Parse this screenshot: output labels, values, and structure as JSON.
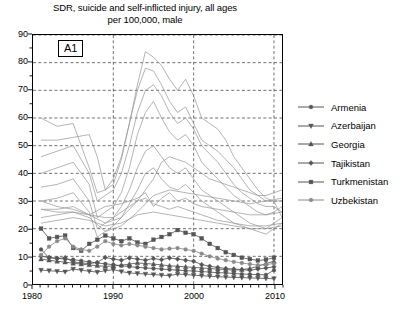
{
  "chart_data": {
    "type": "line",
    "title": "SDR, suicide and self-inflicted injury, all ages per 100,000, male",
    "title_line1": "SDR, suicide and self-inflicted injury, all ages",
    "title_line2": "per 100,000, male",
    "panel_label": "A1",
    "xlabel": "",
    "ylabel": "",
    "xlim": [
      1980,
      2011
    ],
    "ylim": [
      0,
      90
    ],
    "ytick_step": 10,
    "yminor_step": 5,
    "grid": true,
    "grid_style": "dashed",
    "legend_position": "right",
    "xticks": [
      1980,
      1990,
      2000,
      2010
    ],
    "xtick_labels": [
      "1980",
      "1990",
      "2000",
      "2010"
    ],
    "yticks": [
      0,
      10,
      20,
      30,
      40,
      50,
      60,
      70,
      80,
      90
    ],
    "ytick_labels": [
      "0",
      "10",
      "20",
      "30",
      "40",
      "50",
      "60",
      "70",
      "80",
      "90"
    ],
    "series": [
      {
        "name": "Armenia",
        "marker": "circle",
        "color": "#555555",
        "x": [
          1981,
          1982,
          1983,
          1984,
          1985,
          1986,
          1987,
          1988,
          1989,
          1990,
          1991,
          1992,
          1993,
          1994,
          1995,
          1996,
          1997,
          1998,
          1999,
          2000,
          2001,
          2002,
          2003,
          2004,
          2005,
          2006,
          2007,
          2008,
          2009,
          2010
        ],
        "y": [
          12.5,
          9.5,
          9.3,
          9.0,
          8.8,
          8.4,
          8.0,
          7.6,
          7.3,
          7.0,
          6.6,
          6.3,
          6.0,
          5.8,
          5.6,
          5.4,
          5.2,
          5.0,
          4.8,
          4.7,
          4.5,
          4.3,
          4.1,
          4.0,
          3.8,
          3.6,
          3.5,
          3.4,
          3.3,
          5.0
        ]
      },
      {
        "name": "Azerbaijan",
        "marker": "triangle-down",
        "color": "#555555",
        "x": [
          1981,
          1982,
          1983,
          1984,
          1985,
          1986,
          1987,
          1988,
          1989,
          1990,
          1991,
          1992,
          1993,
          1994,
          1995,
          1996,
          1997,
          1998,
          1999,
          2000,
          2001,
          2002,
          2003,
          2004,
          2005,
          2006,
          2007,
          2008,
          2009,
          2010
        ],
        "y": [
          5.0,
          4.8,
          4.6,
          4.4,
          5.4,
          5.0,
          4.6,
          4.3,
          4.8,
          5.2,
          4.5,
          4.0,
          3.8,
          3.6,
          3.4,
          3.2,
          3.0,
          3.6,
          3.4,
          3.2,
          3.0,
          2.8,
          2.6,
          2.5,
          2.4,
          2.3,
          2.2,
          2.1,
          2.0,
          1.9
        ]
      },
      {
        "name": "Georgia",
        "marker": "triangle-up",
        "color": "#555555",
        "x": [
          1981,
          1982,
          1983,
          1984,
          1985,
          1986,
          1987,
          1988,
          1989,
          1990,
          1991,
          1992,
          1993,
          1994,
          1995,
          1996,
          1997,
          1998,
          1999,
          2000,
          2001,
          2002,
          2003,
          2004,
          2005,
          2006,
          2007,
          2008,
          2009,
          2010
        ],
        "y": [
          9.0,
          8.6,
          8.2,
          7.9,
          7.5,
          7.2,
          6.9,
          6.6,
          6.4,
          6.5,
          6.8,
          7.2,
          7.6,
          7.4,
          7.2,
          6.9,
          6.6,
          6.4,
          6.2,
          6.0,
          5.8,
          5.6,
          5.4,
          5.2,
          5.0,
          5.2,
          5.6,
          6.4,
          7.4,
          8.2
        ]
      },
      {
        "name": "Tajikistan",
        "marker": "diamond",
        "color": "#555555",
        "x": [
          1981,
          1982,
          1983,
          1984,
          1985,
          1986,
          1987,
          1988,
          1989,
          1990,
          1991,
          1992,
          1993,
          1994,
          1995,
          1996,
          1997,
          1998,
          1999,
          2000,
          2001,
          2002,
          2003,
          2004,
          2005,
          2006,
          2007,
          2008,
          2009,
          2010
        ],
        "y": [
          10.0,
          9.6,
          9.2,
          9.5,
          8.0,
          7.6,
          7.4,
          7.8,
          9.6,
          9.0,
          8.6,
          9.4,
          9.0,
          8.6,
          9.2,
          8.8,
          9.4,
          9.0,
          8.6,
          8.2,
          7.0,
          6.4,
          6.0,
          5.6,
          5.4,
          5.2,
          5.0,
          5.4,
          5.8,
          6.2
        ]
      },
      {
        "name": "Turkmenistan",
        "marker": "square",
        "color": "#555555",
        "x": [
          1981,
          1982,
          1983,
          1984,
          1985,
          1986,
          1987,
          1988,
          1989,
          1990,
          1991,
          1992,
          1993,
          1994,
          1995,
          1996,
          1997,
          1998,
          1999,
          2000,
          2001,
          2002,
          2003,
          2004,
          2005,
          2006,
          2007,
          2008,
          2009,
          2010
        ],
        "y": [
          20.0,
          16.5,
          17.0,
          17.5,
          13.0,
          12.0,
          14.5,
          16.0,
          17.5,
          16.5,
          15.5,
          16.5,
          15.0,
          14.5,
          16.0,
          17.0,
          18.0,
          19.5,
          18.5,
          18.0,
          16.5,
          14.5,
          13.0,
          11.5,
          10.5,
          9.5,
          9.0,
          8.5,
          8.8,
          9.5
        ]
      },
      {
        "name": "Uzbekistan",
        "marker": "circle",
        "color": "#8a8a8a",
        "x": [
          1981,
          1982,
          1983,
          1984,
          1985,
          1986,
          1987,
          1988,
          1989,
          1990,
          1991,
          1992,
          1993,
          1994,
          1995,
          1996,
          1997,
          1998,
          1999,
          2000,
          2001,
          2002,
          2003,
          2004,
          2005,
          2006,
          2007,
          2008,
          2009,
          2010
        ],
        "y": [
          10.5,
          13.5,
          15.5,
          16.5,
          13.5,
          12.5,
          12.0,
          13.5,
          15.5,
          14.5,
          14.0,
          14.5,
          14.0,
          13.5,
          13.0,
          12.5,
          12.8,
          13.0,
          12.5,
          12.0,
          11.0,
          10.0,
          9.2,
          8.6,
          8.0,
          7.6,
          7.2,
          6.8,
          7.0,
          7.4
        ]
      }
    ],
    "background_series": [
      {
        "name": "background-1",
        "color": "#9a9a9a",
        "x": [
          1981,
          1983,
          1985,
          1987,
          1988,
          1989,
          1990,
          1991,
          1992,
          1993,
          1994,
          1995,
          1996,
          1997,
          1998,
          1999,
          2000,
          2001,
          2002,
          2003,
          2004,
          2005,
          2006,
          2007,
          2008,
          2009,
          2010,
          2011
        ],
        "y": [
          52,
          52,
          53,
          54,
          46,
          34,
          36,
          45,
          58,
          72,
          84,
          82,
          79,
          74,
          70,
          74,
          68,
          60,
          58,
          56,
          52,
          46,
          42,
          38,
          34,
          31,
          30,
          30
        ]
      },
      {
        "name": "background-2",
        "color": "#9a9a9a",
        "x": [
          1981,
          1983,
          1985,
          1987,
          1988,
          1989,
          1990,
          1991,
          1992,
          1993,
          1994,
          1995,
          1996,
          1997,
          1998,
          1999,
          2000,
          2001,
          2002,
          2003,
          2004,
          2005,
          2006,
          2007,
          2008,
          2009,
          2010,
          2011
        ],
        "y": [
          60,
          57,
          58,
          42,
          33,
          34,
          38,
          46,
          58,
          70,
          78,
          77,
          72,
          66,
          62,
          64,
          58,
          52,
          50,
          48,
          45,
          42,
          38,
          34,
          32,
          30,
          30,
          24
        ]
      },
      {
        "name": "background-3",
        "color": "#9a9a9a",
        "x": [
          1981,
          1983,
          1985,
          1987,
          1988,
          1989,
          1990,
          1991,
          1992,
          1993,
          1994,
          1995,
          1996,
          1997,
          1998,
          1999,
          2000,
          2001,
          2002,
          2003,
          2004,
          2005,
          2006,
          2007,
          2008,
          2009,
          2010,
          2011
        ],
        "y": [
          46,
          48,
          50,
          40,
          30,
          32,
          34,
          40,
          50,
          62,
          70,
          72,
          68,
          62,
          58,
          60,
          56,
          50,
          47,
          44,
          40,
          36,
          33,
          31,
          29,
          28,
          28,
          26
        ]
      },
      {
        "name": "background-4",
        "color": "#9a9a9a",
        "x": [
          1981,
          1983,
          1985,
          1987,
          1988,
          1989,
          1990,
          1991,
          1992,
          1993,
          1994,
          1995,
          1996,
          1997,
          1998,
          1999,
          2000,
          2001,
          2002,
          2003,
          2004,
          2005,
          2006,
          2007,
          2008,
          2009,
          2010,
          2011
        ],
        "y": [
          40,
          42,
          44,
          36,
          24,
          26,
          28,
          33,
          42,
          54,
          62,
          66,
          60,
          55,
          52,
          54,
          50,
          44,
          41,
          38,
          35,
          32,
          30,
          28,
          26,
          25,
          26,
          28
        ]
      },
      {
        "name": "background-5",
        "color": "#9a9a9a",
        "x": [
          1981,
          1983,
          1985,
          1987,
          1988,
          1989,
          1990,
          1991,
          1992,
          1993,
          1994,
          1995,
          1996,
          1997,
          1998,
          1999,
          2000,
          2001,
          2002,
          2003,
          2004,
          2005,
          2006,
          2007,
          2008,
          2009,
          2010,
          2011
        ],
        "y": [
          35,
          36,
          38,
          30,
          20,
          22,
          24,
          28,
          34,
          42,
          48,
          50,
          46,
          42,
          40,
          42,
          38,
          34,
          32,
          30,
          28,
          26,
          24,
          22,
          21,
          20,
          22,
          24
        ]
      },
      {
        "name": "background-6",
        "color": "#9a9a9a",
        "x": [
          1981,
          1983,
          1985,
          1987,
          1988,
          1989,
          1990,
          1991,
          1992,
          1993,
          1994,
          1995,
          1996,
          1997,
          1998,
          1999,
          2000,
          2001,
          2002,
          2003,
          2004,
          2005,
          2006,
          2007,
          2008,
          2009,
          2010,
          2011
        ],
        "y": [
          30,
          31,
          33,
          26,
          17,
          19,
          21,
          24,
          29,
          34,
          40,
          42,
          38,
          35,
          34,
          36,
          33,
          30,
          28,
          26,
          24,
          22,
          21,
          20,
          19,
          18,
          20,
          22
        ]
      },
      {
        "name": "background-7",
        "color": "#9a9a9a",
        "x": [
          1981,
          1983,
          1985,
          1987,
          1989,
          1991,
          1993,
          1995,
          1996,
          1997,
          1998,
          1999,
          2000,
          2001,
          2002,
          2003,
          2004,
          2005,
          2006,
          2007,
          2008,
          2009,
          2010,
          2011
        ],
        "y": [
          27,
          27,
          28,
          25,
          22,
          24,
          30,
          38,
          44,
          46,
          45,
          44,
          42,
          40,
          38,
          37,
          36,
          35,
          34,
          33,
          32,
          32,
          33,
          34
        ]
      },
      {
        "name": "background-8",
        "color": "#9a9a9a",
        "x": [
          1981,
          1983,
          1985,
          1987,
          1989,
          1991,
          1993,
          1995,
          1997,
          1999,
          2001,
          2003,
          2005,
          2007,
          2009,
          2011
        ],
        "y": [
          24,
          25,
          26,
          24,
          19,
          21,
          26,
          32,
          34,
          33,
          32,
          31,
          30,
          29,
          30,
          31
        ]
      },
      {
        "name": "background-9",
        "color": "#9a9a9a",
        "x": [
          1981,
          1983,
          1985,
          1987,
          1989,
          1990,
          1991,
          1992,
          1993,
          1994,
          1995,
          1996,
          1997,
          1998,
          1999,
          2000,
          2001,
          2002,
          2003,
          2005,
          2007,
          2009,
          2011
        ],
        "y": [
          30,
          28,
          27,
          25,
          24,
          24,
          26,
          28,
          30,
          31,
          29,
          28,
          27,
          28,
          27,
          26,
          25,
          24,
          23,
          22,
          21,
          21,
          22
        ]
      },
      {
        "name": "background-10",
        "color": "#9a9a9a",
        "x": [
          1981,
          1983,
          1985,
          1987,
          1989,
          1991,
          1993,
          1995,
          1997,
          1999,
          2001,
          2003,
          2005,
          2007,
          2009,
          2011
        ],
        "y": [
          22,
          23,
          24,
          23,
          21,
          22,
          25,
          26,
          25,
          24,
          23,
          22,
          21,
          20,
          20,
          21
        ]
      },
      {
        "name": "background-11",
        "color": "#9a9a9a",
        "x": [
          1981,
          1983,
          1985,
          1987,
          1989,
          1991,
          1993,
          1994,
          1995,
          1996,
          1997,
          1998,
          1999,
          2000,
          2001,
          2003,
          2005,
          2007,
          2009,
          2011
        ],
        "y": [
          27,
          26,
          26,
          25,
          28,
          29,
          31,
          33,
          28,
          31,
          33,
          30,
          31,
          29,
          28,
          27,
          26,
          25,
          25,
          26
        ]
      }
    ]
  },
  "legend": {
    "items": [
      {
        "label": "Armenia",
        "marker": "circle"
      },
      {
        "label": "Azerbaijan",
        "marker": "triangle-down"
      },
      {
        "label": "Georgia",
        "marker": "triangle-up"
      },
      {
        "label": "Tajikistan",
        "marker": "diamond"
      },
      {
        "label": "Turkmenistan",
        "marker": "square"
      },
      {
        "label": "Uzbekistan",
        "marker": "circle"
      }
    ]
  }
}
